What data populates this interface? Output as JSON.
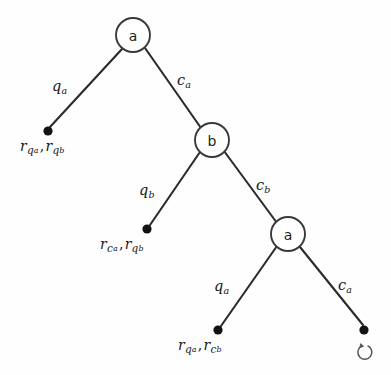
{
  "diagram": {
    "type": "game-tree",
    "title": "",
    "background_color": "#fefefe",
    "stroke_color": "#2b2b2b",
    "nodes": [
      {
        "id": "root",
        "label": "a",
        "x": 133,
        "y": 35,
        "r": 17,
        "kind": "decision"
      },
      {
        "id": "n_b",
        "label": "b",
        "x": 212,
        "y": 140,
        "r": 17,
        "kind": "decision"
      },
      {
        "id": "n_a2",
        "label": "a",
        "x": 288,
        "y": 234,
        "r": 17,
        "kind": "decision"
      }
    ],
    "terminals": [
      {
        "id": "t1",
        "x": 48,
        "y": 131,
        "r": 4.5,
        "label_x": 20,
        "label_y": 138
      },
      {
        "id": "t2",
        "x": 147,
        "y": 229,
        "r": 4.5,
        "label_x": 100,
        "label_y": 236
      },
      {
        "id": "t3",
        "x": 218,
        "y": 330,
        "r": 4.5,
        "label_x": 178,
        "label_y": 337
      },
      {
        "id": "t4",
        "x": 364,
        "y": 330,
        "r": 4.5,
        "label_x": 0,
        "label_y": 0
      }
    ],
    "edges": [
      {
        "id": "e1",
        "from": "root",
        "to": "t1",
        "label": "q",
        "sub": "a",
        "label_x": 52,
        "label_y": 78
      },
      {
        "id": "e2",
        "from": "root",
        "to": "n_b",
        "label": "c",
        "sub": "a",
        "label_x": 177,
        "label_y": 72
      },
      {
        "id": "e3",
        "from": "n_b",
        "to": "t2",
        "label": "q",
        "sub": "b",
        "label_x": 139,
        "label_y": 182
      },
      {
        "id": "e4",
        "from": "n_b",
        "to": "t4",
        "label": "c",
        "sub": "b",
        "label_x": 256,
        "label_y": 177
      },
      {
        "id": "e5",
        "from": "n_a2",
        "to": "t3",
        "label": "q",
        "sub": "a",
        "label_x": 214,
        "label_y": 278
      },
      {
        "id": "e6",
        "from": "n_a2",
        "to": "t4",
        "label": "c",
        "sub": "a",
        "label_x": 338,
        "label_y": 277
      }
    ],
    "terminal_labels": [
      {
        "id": "t1",
        "parts": [
          {
            "base": "r",
            "sub": "q",
            "subsub": "a"
          },
          {
            "base": "r",
            "sub": "q",
            "subsub": "b"
          }
        ]
      },
      {
        "id": "t2",
        "parts": [
          {
            "base": "r",
            "sub": "c",
            "subsub": "a"
          },
          {
            "base": "r",
            "sub": "q",
            "subsub": "b"
          }
        ]
      },
      {
        "id": "t3",
        "parts": [
          {
            "base": "r",
            "sub": "q",
            "subsub": "a"
          },
          {
            "base": "r",
            "sub": "c",
            "subsub": "b"
          }
        ]
      }
    ],
    "separator": ",",
    "loop_marker": {
      "name": "loop-arrow-icon",
      "x": 364,
      "y": 352,
      "r": 7,
      "description": "circular arrow indicating return to the start"
    }
  }
}
